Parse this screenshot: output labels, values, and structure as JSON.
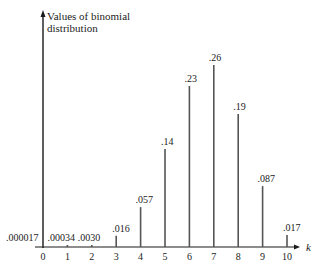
{
  "chart_data": {
    "type": "bar",
    "title": "",
    "xlabel": "k",
    "ylabel": "Values of binomial distribution",
    "ylabel_lines": [
      "Values of binomial",
      "distribution"
    ],
    "categories": [
      "0",
      "1",
      "2",
      "3",
      "4",
      "5",
      "6",
      "7",
      "8",
      "9",
      "10"
    ],
    "values": [
      1.7e-05,
      0.00034,
      0.003,
      0.016,
      0.057,
      0.14,
      0.23,
      0.26,
      0.19,
      0.087,
      0.017
    ],
    "data_labels": [
      ".000017",
      ".00034",
      ".0030",
      ".016",
      ".057",
      ".14",
      ".23",
      ".26",
      ".19",
      ".087",
      ".017"
    ],
    "ylim": [
      0,
      0.27
    ],
    "grid": false,
    "legend": null,
    "style": "stem"
  },
  "colors": {
    "axis": "#1a1a1a",
    "stem": "#555555",
    "text": "#222222",
    "background": "#ffffff"
  }
}
